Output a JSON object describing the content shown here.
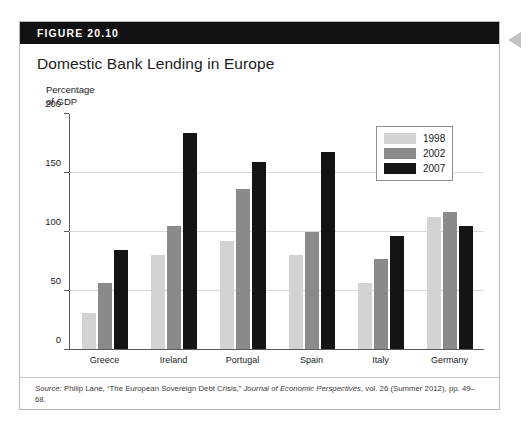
{
  "figure": {
    "label": "FIGURE 20.10",
    "title": "Domestic Bank Lending in Europe"
  },
  "axis_caption": "Percentage\nof GDP",
  "source": {
    "prefix": "Source:",
    "text_1": " Philip Lane, “The European Sovereign Debt Crisis,” ",
    "journal": "Journal of Economic Perspectives",
    "text_2": ", vol. 26 (Summer 2012), pp. 49–68."
  },
  "legend": {
    "items": [
      {
        "label": "1998",
        "color": "#d3d3d3"
      },
      {
        "label": "2002",
        "color": "#8a8a8a"
      },
      {
        "label": "2007",
        "color": "#141414"
      }
    ]
  },
  "chart_data": {
    "type": "bar",
    "title": "Domestic Bank Lending in Europe",
    "xlabel": "",
    "ylabel": "Percentage of GDP",
    "ylim": [
      0,
      200
    ],
    "yticks": [
      0,
      50,
      100,
      150,
      200
    ],
    "grid": true,
    "legend_position": "top-right",
    "categories": [
      "Greece",
      "Ireland",
      "Portugal",
      "Spain",
      "Italy",
      "Germany"
    ],
    "series": [
      {
        "name": "1998",
        "color": "#d3d3d3",
        "values": [
          31,
          80,
          92,
          80,
          56,
          112
        ]
      },
      {
        "name": "2002",
        "color": "#8a8a8a",
        "values": [
          56,
          105,
          136,
          100,
          77,
          117
        ]
      },
      {
        "name": "2007",
        "color": "#141414",
        "values": [
          84,
          184,
          159,
          168,
          96,
          105
        ]
      }
    ]
  }
}
